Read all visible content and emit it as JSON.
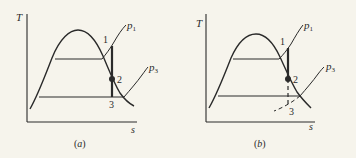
{
  "figure": {
    "panels": [
      {
        "id": "a",
        "caption": "(a)",
        "axes": {
          "y_label": "T",
          "x_label": "s"
        },
        "isobars": {
          "upper": "p",
          "upper_sub": "1",
          "lower": "p",
          "lower_sub": "3"
        },
        "states": {
          "s1": "1",
          "s2": "2",
          "s3": "3"
        },
        "expansion_to_3": "solid vertical line"
      },
      {
        "id": "b",
        "caption": "(b)",
        "axes": {
          "y_label": "T",
          "x_label": "s"
        },
        "isobars": {
          "upper": "p",
          "upper_sub": "1",
          "lower": "p",
          "lower_sub": "3"
        },
        "states": {
          "s1": "1",
          "s2": "2",
          "s3": "3"
        },
        "expansion_to_3": "dashed vertical line; p3 extended dashed below saturation dome"
      }
    ],
    "colors": {
      "ink": "#2a2a2a",
      "paper": "#f6f4ec"
    }
  }
}
